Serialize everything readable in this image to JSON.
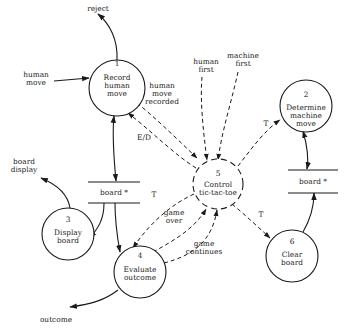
{
  "diagram": {
    "type": "data-flow-diagram",
    "processes": [
      {
        "id": "1",
        "number": "1",
        "lines": [
          "Record",
          "human",
          "move"
        ]
      },
      {
        "id": "2",
        "number": "2",
        "lines": [
          "Determine",
          "machine",
          "move"
        ]
      },
      {
        "id": "3",
        "number": "3",
        "lines": [
          "Display",
          "board"
        ]
      },
      {
        "id": "4",
        "number": "4",
        "lines": [
          "Evaluate",
          "outcome"
        ]
      },
      {
        "id": "5",
        "number": "5",
        "lines": [
          "Control",
          "tic-tac-toe"
        ],
        "style": "dashed"
      },
      {
        "id": "6",
        "number": "6",
        "lines": [
          "Clear",
          "board"
        ]
      }
    ],
    "stores": [
      {
        "id": "board-left",
        "label": "board *"
      },
      {
        "id": "board-right",
        "label": "board *"
      }
    ],
    "external_flows": {
      "reject": "reject",
      "human_move": [
        "human",
        "move"
      ],
      "board_display": [
        "board",
        "display"
      ],
      "outcome": "outcome"
    },
    "control_flows": {
      "human_first": [
        "human",
        "first"
      ],
      "machine_first": [
        "machine",
        "first"
      ],
      "human_move_recorded": [
        "human",
        "move",
        "recorded"
      ],
      "ed": "E/D",
      "t_to_2": "T",
      "t_to_4": "T",
      "t_to_6": "T",
      "game_over": [
        "game",
        "over"
      ],
      "game_continues": [
        "game",
        "continues"
      ]
    }
  }
}
